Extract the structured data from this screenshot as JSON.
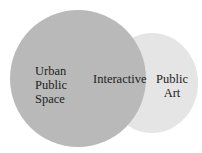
{
  "diagram": {
    "type": "venn",
    "sets": [
      {
        "name": "Urban Public Space",
        "lines": [
          "Urban",
          "Public",
          "Space"
        ],
        "color": "#b9b9b9"
      },
      {
        "name": "Public Art",
        "lines": [
          "Public",
          "Art"
        ],
        "color": "#e5e5e5"
      }
    ],
    "intersection": {
      "label": "Interactive"
    }
  }
}
